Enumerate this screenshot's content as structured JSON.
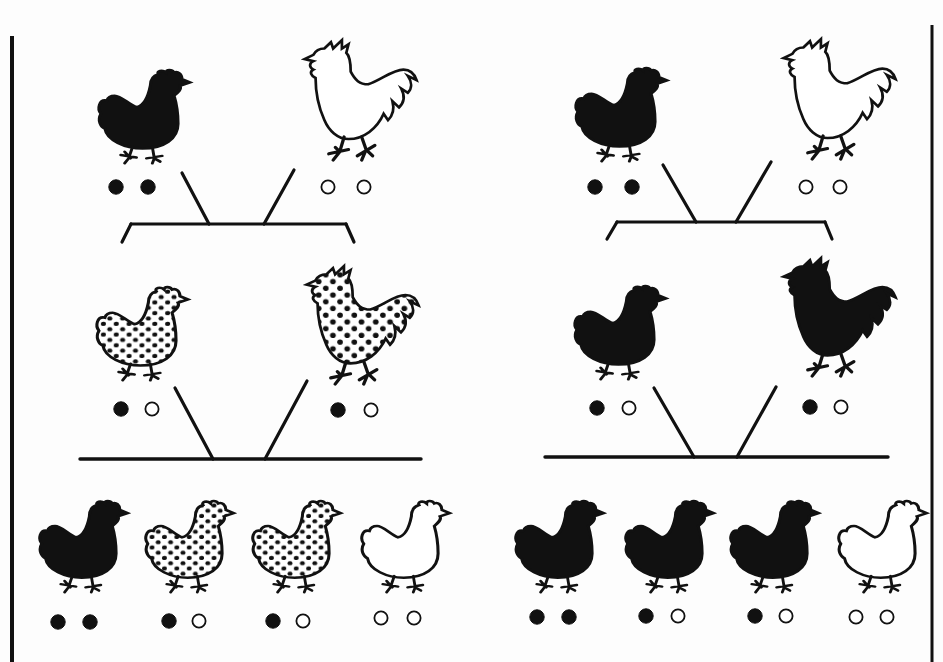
{
  "figure": {
    "width": 943,
    "height": 662,
    "background": "#fdfdfd",
    "ink": "#111111",
    "borders": [
      {
        "name": "left-panel-border",
        "x": 12,
        "y1": 36,
        "y2": 662,
        "width": 4
      },
      {
        "name": "right-panel-border",
        "x": 932,
        "y1": 25,
        "y2": 662,
        "width": 3
      }
    ]
  },
  "panels": [
    {
      "name": "incomplete-dominance-cross",
      "parents": [
        {
          "kind": "hen",
          "fill": "black",
          "x": 95,
          "y": 66,
          "w": 85,
          "h": 94,
          "alleles": [
            "B",
            "B"
          ],
          "dots": [
            {
              "x": 116,
              "y": 187,
              "filled": true
            },
            {
              "x": 148,
              "y": 187,
              "filled": true
            }
          ]
        },
        {
          "kind": "rooster",
          "fill": "white",
          "x": 298,
          "y": 38,
          "w": 112,
          "h": 120,
          "alleles": [
            "W",
            "W"
          ],
          "dots": [
            {
              "x": 328,
              "y": 187,
              "filled": false
            },
            {
              "x": 364,
              "y": 187,
              "filled": false
            }
          ]
        }
      ],
      "bracket": {
        "y": 224,
        "x1": 131,
        "x2": 346,
        "left_end": [
          122,
          242
        ],
        "right_end": [
          354,
          242
        ]
      },
      "parent_lines": [
        {
          "x1": 182,
          "y1": 173,
          "x2": 209,
          "y2": 224
        },
        {
          "x1": 294,
          "y1": 170,
          "x2": 264,
          "y2": 224
        }
      ],
      "f1": [
        {
          "kind": "hen",
          "fill": "speckled",
          "x": 93,
          "y": 283,
          "w": 85,
          "h": 94,
          "alleles": [
            "B",
            "W"
          ],
          "dots": [
            {
              "x": 121,
              "y": 409,
              "filled": true
            },
            {
              "x": 152,
              "y": 409,
              "filled": false
            }
          ]
        },
        {
          "kind": "rooster",
          "fill": "speckled",
          "x": 300,
          "y": 264,
          "w": 112,
          "h": 118,
          "alleles": [
            "B",
            "W"
          ],
          "dots": [
            {
              "x": 338,
              "y": 410,
              "filled": true
            },
            {
              "x": 371,
              "y": 410,
              "filled": false
            }
          ]
        }
      ],
      "f1_lines": [
        {
          "x1": 175,
          "y1": 388,
          "x2": 213,
          "y2": 459
        },
        {
          "x1": 307,
          "y1": 381,
          "x2": 265,
          "y2": 459
        }
      ],
      "offspring_bar": {
        "y": 459,
        "x1": 80,
        "x2": 421
      },
      "f2": [
        {
          "kind": "hen",
          "fill": "black",
          "x": 36,
          "y": 497,
          "w": 82,
          "h": 92,
          "alleles": [
            "B",
            "B"
          ],
          "dots": [
            {
              "x": 58,
              "y": 622,
              "filled": true
            },
            {
              "x": 90,
              "y": 622,
              "filled": true
            }
          ]
        },
        {
          "kind": "hen",
          "fill": "speckled",
          "x": 142,
          "y": 497,
          "w": 82,
          "h": 92,
          "alleles": [
            "B",
            "W"
          ],
          "dots": [
            {
              "x": 169,
              "y": 621,
              "filled": true
            },
            {
              "x": 199,
              "y": 621,
              "filled": false
            }
          ]
        },
        {
          "kind": "hen",
          "fill": "speckled",
          "x": 249,
          "y": 497,
          "w": 82,
          "h": 92,
          "alleles": [
            "B",
            "W"
          ],
          "dots": [
            {
              "x": 273,
              "y": 621,
              "filled": true
            },
            {
              "x": 303,
              "y": 621,
              "filled": false
            }
          ]
        },
        {
          "kind": "hen",
          "fill": "white",
          "x": 358,
          "y": 497,
          "w": 82,
          "h": 92,
          "alleles": [
            "W",
            "W"
          ],
          "dots": [
            {
              "x": 381,
              "y": 618,
              "filled": false
            },
            {
              "x": 414,
              "y": 618,
              "filled": false
            }
          ]
        }
      ]
    },
    {
      "name": "complete-dominance-cross",
      "parents": [
        {
          "kind": "hen",
          "fill": "black",
          "x": 572,
          "y": 64,
          "w": 85,
          "h": 94,
          "alleles": [
            "B",
            "B"
          ],
          "dots": [
            {
              "x": 595,
              "y": 187,
              "filled": true
            },
            {
              "x": 632,
              "y": 187,
              "filled": true
            }
          ]
        },
        {
          "kind": "rooster",
          "fill": "white",
          "x": 777,
          "y": 37,
          "w": 112,
          "h": 120,
          "alleles": [
            "W",
            "W"
          ],
          "dots": [
            {
              "x": 806,
              "y": 187,
              "filled": false
            },
            {
              "x": 840,
              "y": 187,
              "filled": false
            }
          ]
        }
      ],
      "bracket": {
        "y": 222,
        "x1": 617,
        "x2": 825,
        "left_end": [
          607,
          239
        ],
        "right_end": [
          832,
          239
        ]
      },
      "parent_lines": [
        {
          "x1": 663,
          "y1": 165,
          "x2": 696,
          "y2": 222
        },
        {
          "x1": 771,
          "y1": 162,
          "x2": 736,
          "y2": 222
        }
      ],
      "f1": [
        {
          "kind": "hen",
          "fill": "black",
          "x": 571,
          "y": 282,
          "w": 85,
          "h": 94,
          "alleles": [
            "B",
            "W"
          ],
          "dots": [
            {
              "x": 597,
              "y": 408,
              "filled": true
            },
            {
              "x": 629,
              "y": 408,
              "filled": false
            }
          ]
        },
        {
          "kind": "rooster",
          "fill": "black",
          "x": 777,
          "y": 256,
          "w": 112,
          "h": 118,
          "alleles": [
            "B",
            "W"
          ],
          "dots": [
            {
              "x": 810,
              "y": 407,
              "filled": true
            },
            {
              "x": 841,
              "y": 407,
              "filled": false
            }
          ]
        }
      ],
      "f1_lines": [
        {
          "x1": 654,
          "y1": 388,
          "x2": 694,
          "y2": 457
        },
        {
          "x1": 776,
          "y1": 387,
          "x2": 737,
          "y2": 457
        }
      ],
      "offspring_bar": {
        "y": 457,
        "x1": 545,
        "x2": 888
      },
      "f2": [
        {
          "kind": "hen",
          "fill": "black",
          "x": 512,
          "y": 497,
          "w": 82,
          "h": 92,
          "alleles": [
            "B",
            "B"
          ],
          "dots": [
            {
              "x": 537,
              "y": 617,
              "filled": true
            },
            {
              "x": 569,
              "y": 617,
              "filled": true
            }
          ]
        },
        {
          "kind": "hen",
          "fill": "black",
          "x": 622,
          "y": 497,
          "w": 82,
          "h": 92,
          "alleles": [
            "B",
            "W"
          ],
          "dots": [
            {
              "x": 646,
              "y": 616,
              "filled": true
            },
            {
              "x": 678,
              "y": 616,
              "filled": false
            }
          ]
        },
        {
          "kind": "hen",
          "fill": "black",
          "x": 727,
          "y": 497,
          "w": 82,
          "h": 92,
          "alleles": [
            "B",
            "W"
          ],
          "dots": [
            {
              "x": 755,
              "y": 616,
              "filled": true
            },
            {
              "x": 786,
              "y": 616,
              "filled": false
            }
          ]
        },
        {
          "kind": "hen",
          "fill": "white",
          "x": 835,
          "y": 497,
          "w": 82,
          "h": 92,
          "alleles": [
            "W",
            "W"
          ],
          "dots": [
            {
              "x": 856,
              "y": 617,
              "filled": false
            },
            {
              "x": 887,
              "y": 617,
              "filled": false
            }
          ]
        }
      ]
    }
  ],
  "legend": {
    "filled_dot": "black allele",
    "open_dot": "white allele",
    "speckled_fill": "heterozygous blended (speckled) phenotype"
  }
}
